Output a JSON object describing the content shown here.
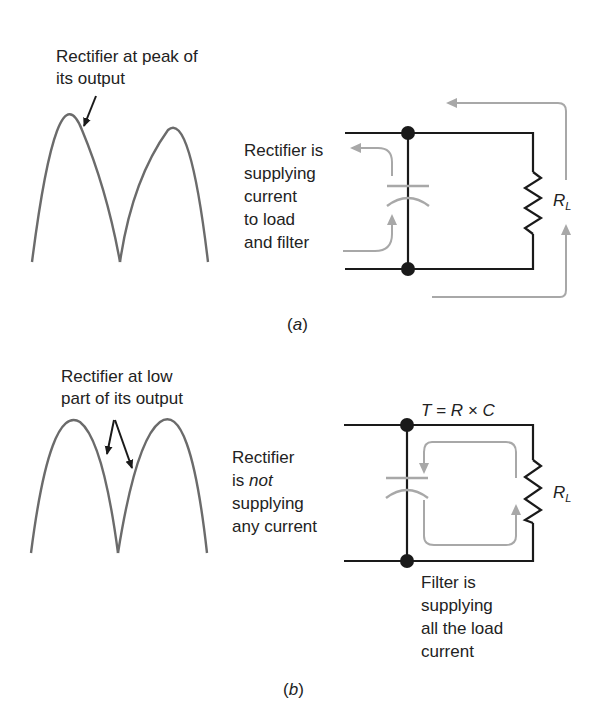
{
  "panel_a": {
    "caption": "(a)",
    "waveform_label_line1": "Rectifier at peak of",
    "waveform_label_line2": "its output",
    "circuit_label_lines": [
      "Rectifier is",
      "supplying",
      "current",
      "to load",
      "and filter"
    ],
    "load_label": "R",
    "load_subscript": "L"
  },
  "panel_b": {
    "caption": "(b)",
    "waveform_label_line1": "Rectifier at low",
    "waveform_label_line2": "part of its output",
    "circuit_label_line1": "Rectifier",
    "circuit_label_line2_pre": "is ",
    "circuit_label_line2_italic": "not",
    "circuit_label_line3": "supplying",
    "circuit_label_line4": "any current",
    "time_constant": "T = R × C",
    "load_label": "R",
    "load_subscript": "L",
    "filter_label_lines": [
      "Filter is",
      "supplying",
      "all the load",
      "current"
    ]
  },
  "colors": {
    "wire": "#1a1a1a",
    "waveform": "#6b6b6b",
    "current_flow": "#a8a8a8",
    "capacitor": "#a8a8a8"
  }
}
